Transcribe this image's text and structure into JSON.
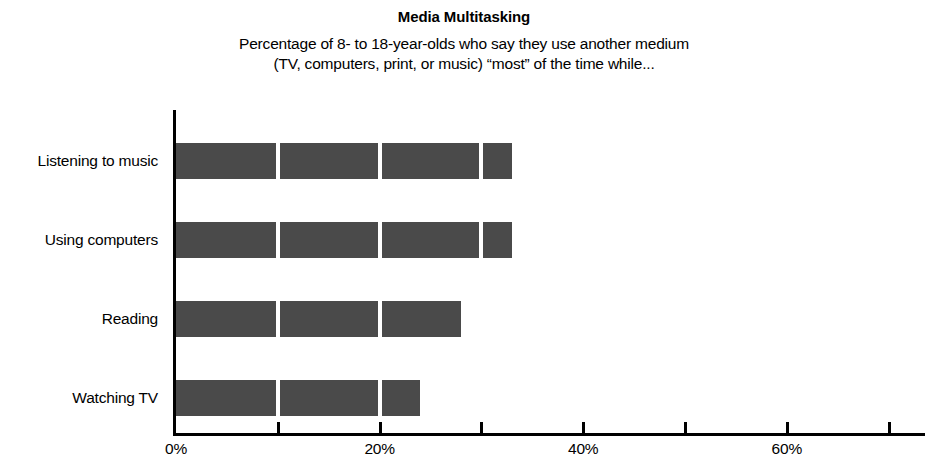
{
  "chart_data": {
    "type": "bar",
    "orientation": "horizontal",
    "title": "Media Multitasking",
    "subtitle_lines": [
      "Percentage of 8- to 18-year-olds who say they use another medium",
      "(TV, computers, print, or music) “most” of the time while..."
    ],
    "categories": [
      "Listening to music",
      "Using computers",
      "Reading",
      "Watching TV"
    ],
    "values": [
      33,
      33,
      28,
      24
    ],
    "xlabel": "",
    "ylabel": "",
    "xlim": [
      0,
      74
    ],
    "ylim": null,
    "grid": false,
    "legend": null,
    "bar_color": "#4a4a4a",
    "axis_color": "#000000",
    "background_color": "#ffffff",
    "x_axis": {
      "tick_values": [
        0,
        10,
        20,
        30,
        40,
        50,
        60,
        70
      ],
      "tick_labels": [
        "0%",
        "",
        "20%",
        "",
        "40%",
        "",
        "60%",
        ""
      ],
      "labeled_ticks": [
        {
          "value": 0,
          "label": "0%"
        },
        {
          "value": 20,
          "label": "20%"
        },
        {
          "value": 40,
          "label": "40%"
        },
        {
          "value": 60,
          "label": "60%"
        }
      ],
      "unit": "percent",
      "tick_interval": 10
    },
    "bar_breaks_at": [
      10,
      20,
      30
    ]
  }
}
